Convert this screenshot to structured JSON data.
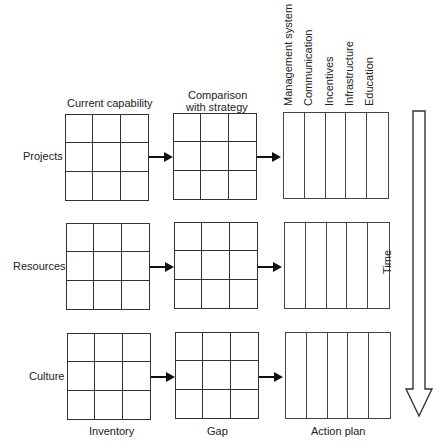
{
  "column_headers": {
    "current": "Current capability",
    "comparison_line1": "Comparison",
    "comparison_line2": "with strategy",
    "action_columns": [
      "Management system",
      "Communication",
      "Incentives",
      "Infrastructure",
      "Education"
    ]
  },
  "rows": [
    {
      "label": "Projects"
    },
    {
      "label": "Resources"
    },
    {
      "label": "Culture"
    }
  ],
  "footer_labels": {
    "inventory": "Inventory",
    "gap": "Gap",
    "action_plan": "Action plan"
  },
  "time_arrow": {
    "label": "Time",
    "direction": "down"
  },
  "colors": {
    "line": "#333333",
    "background": "#ffffff"
  }
}
